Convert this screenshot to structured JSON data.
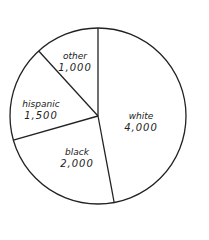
{
  "chart_data": {
    "type": "pie",
    "title": "",
    "categories": [
      "white",
      "black",
      "hispanic",
      "other"
    ],
    "values": [
      4000,
      2000,
      1500,
      1000
    ],
    "labels": [
      "4,000",
      "2,000",
      "1,500",
      "1,000"
    ],
    "start_angle_deg": 0,
    "direction": "clockwise from top",
    "legend": "none (labels inside slices)"
  },
  "slices": [
    {
      "name": "white",
      "value": "4,000"
    },
    {
      "name": "black",
      "value": "2,000"
    },
    {
      "name": "hispanic",
      "value": "1,500"
    },
    {
      "name": "other",
      "value": "1,000"
    }
  ]
}
